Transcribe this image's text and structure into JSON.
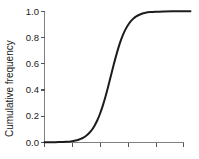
{
  "chart_data": {
    "type": "line",
    "title": "",
    "xlabel": "",
    "ylabel": "Cumulative frequency",
    "ylim": [
      0.0,
      1.0
    ],
    "xlim": [
      0,
      5
    ],
    "grid": false,
    "legend": null,
    "ytick_labels": [
      "1.0",
      "0.8",
      "0.6",
      "0.4",
      "0.2",
      "0.0"
    ],
    "ytick_values": [
      1.0,
      0.8,
      0.6,
      0.4,
      0.2,
      0.0
    ],
    "xtick_labels": [
      "",
      "",
      "",
      "",
      "",
      ""
    ],
    "xtick_values": [
      0,
      1,
      2,
      3,
      4,
      5
    ],
    "series": [
      {
        "name": "cumulative frequency",
        "color": "#1c1c1c",
        "x": [
          0.0,
          0.2,
          0.4,
          0.6,
          0.8,
          1.0,
          1.1,
          1.2,
          1.3,
          1.4,
          1.5,
          1.6,
          1.7,
          1.8,
          1.9,
          2.0,
          2.1,
          2.2,
          2.3,
          2.4,
          2.5,
          2.6,
          2.7,
          2.8,
          2.9,
          3.0,
          3.1,
          3.2,
          3.3,
          3.4,
          3.5,
          3.6,
          3.8,
          4.0,
          4.3,
          4.6,
          5.0,
          5.25
        ],
        "y": [
          0.0,
          0.0,
          0.001,
          0.002,
          0.004,
          0.009,
          0.013,
          0.018,
          0.026,
          0.036,
          0.05,
          0.069,
          0.094,
          0.127,
          0.168,
          0.22,
          0.282,
          0.354,
          0.434,
          0.518,
          0.601,
          0.679,
          0.749,
          0.808,
          0.856,
          0.894,
          0.923,
          0.945,
          0.961,
          0.972,
          0.981,
          0.987,
          0.994,
          0.997,
          0.999,
          1.0,
          1.0,
          1.0
        ]
      }
    ]
  },
  "axes": {
    "ylabel": "Cumulative frequency",
    "ytick_labels": [
      "1.0",
      "0.8",
      "0.6",
      "0.4",
      "0.2",
      "0.0"
    ]
  }
}
